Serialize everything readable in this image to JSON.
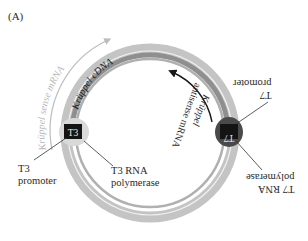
{
  "figure": {
    "panel_label": "(A)",
    "colors": {
      "outer_ring": "#c4c4c4",
      "inner_ring": "#8f8f8f",
      "white_line": "#f2f2f2",
      "t3_blob": "#d9d9d9",
      "t7_blob": "#4a4a4a",
      "marker_box": "#141414",
      "sense_arrow": "#bdbdbd",
      "antisense_arrow": "#1a1a1a"
    },
    "arc_labels": {
      "sense_mrna": "Krüppel sense mRNA",
      "cdna": "Krüppel cDNA",
      "antisense_line1": "Krüppel",
      "antisense_line2": "antisense mRNA"
    },
    "markers": {
      "t3": "T3",
      "t7": "T7"
    },
    "callouts": {
      "t3_promoter_line1": "T3",
      "t3_promoter_line2": "promoter",
      "t3_polymerase_line1": "T3 RNA",
      "t3_polymerase_line2": "polymerase",
      "t7_promoter_line1": "T7",
      "t7_promoter_line2": "promoter",
      "t7_polymerase_line1": "T7 RNA",
      "t7_polymerase_line2": "polymerase"
    }
  }
}
